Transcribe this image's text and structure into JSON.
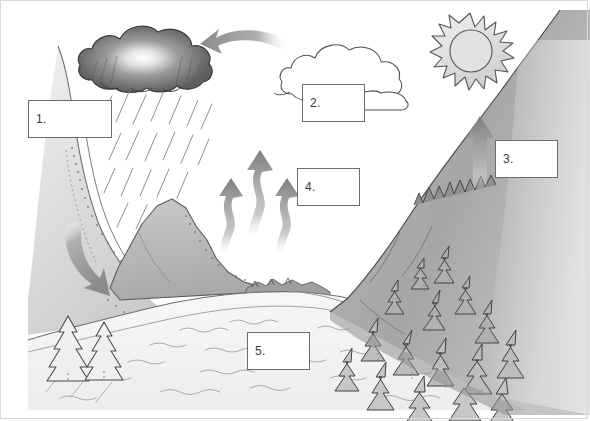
{
  "diagram": {
    "type": "labeled-illustration",
    "background_color": "#ffffff",
    "border_color": "#d8d8d8",
    "ink_color": "#4a4a4a",
    "arrow_color": "#8c8c8c",
    "mountain_fill": "#bdbdbd",
    "forest_fill": "#a8a8a8",
    "cloud_dark_fill": "#6e6e6e"
  },
  "labels": [
    {
      "id": "label-1",
      "text": "1.",
      "x": 28,
      "y": 100,
      "w": 84,
      "h": 38
    },
    {
      "id": "label-2",
      "text": "2.",
      "x": 302,
      "y": 84,
      "w": 63,
      "h": 38
    },
    {
      "id": "label-3",
      "text": "3.",
      "x": 495,
      "y": 140,
      "w": 63,
      "h": 38
    },
    {
      "id": "label-4",
      "text": "4.",
      "x": 297,
      "y": 168,
      "w": 63,
      "h": 38
    },
    {
      "id": "label-5",
      "text": "5.",
      "x": 247,
      "y": 332,
      "w": 63,
      "h": 38
    }
  ],
  "elements": {
    "rain_cloud": "dark-rain-cloud",
    "white_cloud": "white-outline-cloud",
    "sun": "sun-with-rays",
    "rain": "rain-streaks",
    "evaporation_arrows": "three-wavy-up-arrows",
    "transpiration_arrow": "straight-up-arrow",
    "runoff_arrow": "curved-down-arrow",
    "condensation_arrow": "curved-left-arrow",
    "left_mountain": "snow-slope-mountain",
    "center_peak": "gray-rock-peak",
    "right_mountain": "forested-mountain",
    "river": "river-valley",
    "small_trees": "two-small-conifers"
  }
}
